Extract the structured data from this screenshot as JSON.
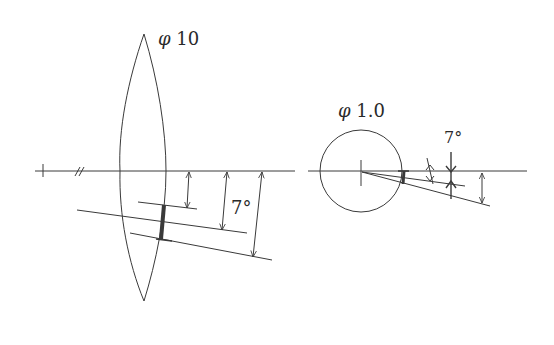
{
  "colors": {
    "stroke": "#3a3a3a",
    "background": "#ffffff"
  },
  "left_diagram": {
    "name": "lens",
    "diameter_label": {
      "symbol": "φ",
      "value": "10"
    },
    "angle_label": "7°",
    "axis_markers": [
      "tick",
      "break-mark //"
    ]
  },
  "right_diagram": {
    "name": "small-aperture",
    "diameter_label": {
      "symbol": "φ",
      "value": "1.0"
    },
    "angle_label": "7°"
  }
}
